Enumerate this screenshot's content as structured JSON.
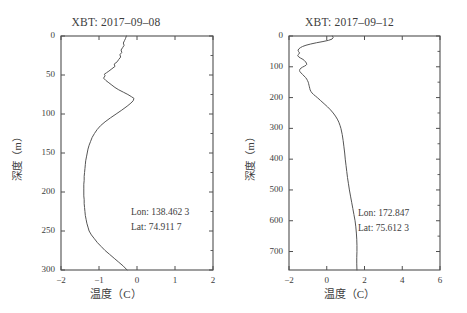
{
  "chart_data": [
    {
      "type": "line",
      "title": "XBT: 2017–09–08",
      "xlabel": "温度（C）",
      "ylabel": "深度（m）",
      "xlim": [
        -2,
        2
      ],
      "ylim": [
        0,
        300
      ],
      "y_inverted": true,
      "grid": false,
      "xticks": [
        -2,
        -1,
        0,
        1,
        2
      ],
      "xtick_labels": [
        "−2",
        "−1",
        "0",
        "1",
        "2"
      ],
      "yticks": [
        0,
        50,
        100,
        150,
        200,
        250,
        300
      ],
      "ytick_labels": [
        "0",
        "50",
        "100",
        "150",
        "200",
        "250",
        "300"
      ],
      "annotations": [
        "Lon: 138.462 3",
        "Lat: 74.911 7"
      ],
      "series_name": "temperature-profile",
      "line_color": "#555555",
      "depth": [
        0,
        3,
        6,
        9,
        12,
        15,
        18,
        21,
        24,
        27,
        30,
        33,
        36,
        39,
        42,
        45,
        47,
        49,
        51,
        54,
        57,
        60,
        63,
        66,
        69,
        72,
        75,
        78,
        80,
        83,
        86,
        90,
        95,
        100,
        105,
        110,
        115,
        120,
        125,
        130,
        135,
        140,
        145,
        150,
        155,
        160,
        165,
        170,
        175,
        180,
        185,
        190,
        195,
        200,
        205,
        210,
        215,
        220,
        225,
        230,
        235,
        240,
        245,
        250,
        255,
        260,
        265,
        270,
        275,
        280,
        285,
        290,
        295,
        300
      ],
      "temperature": [
        -0.28,
        -0.3,
        -0.33,
        -0.36,
        -0.34,
        -0.38,
        -0.42,
        -0.4,
        -0.45,
        -0.43,
        -0.48,
        -0.52,
        -0.6,
        -0.58,
        -0.66,
        -0.74,
        -0.8,
        -0.86,
        -0.84,
        -0.88,
        -0.82,
        -0.74,
        -0.66,
        -0.58,
        -0.48,
        -0.36,
        -0.24,
        -0.14,
        -0.08,
        -0.1,
        -0.16,
        -0.26,
        -0.4,
        -0.55,
        -0.7,
        -0.84,
        -0.96,
        -1.05,
        -1.12,
        -1.18,
        -1.22,
        -1.26,
        -1.29,
        -1.31,
        -1.33,
        -1.35,
        -1.36,
        -1.37,
        -1.38,
        -1.39,
        -1.39,
        -1.4,
        -1.4,
        -1.4,
        -1.4,
        -1.39,
        -1.39,
        -1.38,
        -1.37,
        -1.36,
        -1.34,
        -1.32,
        -1.29,
        -1.26,
        -1.2,
        -1.12,
        -1.04,
        -0.94,
        -0.84,
        -0.72,
        -0.6,
        -0.48,
        -0.36,
        -0.26
      ]
    },
    {
      "type": "line",
      "title": "XBT: 2017–09–12",
      "xlabel": "温度（C）",
      "ylabel": "深度（m）",
      "xlim": [
        -2,
        6
      ],
      "ylim": [
        0,
        760
      ],
      "y_inverted": true,
      "grid": false,
      "xticks": [
        -2,
        0,
        2,
        4,
        6
      ],
      "xtick_labels": [
        "−2",
        "0",
        "2",
        "4",
        "6"
      ],
      "yticks": [
        0,
        100,
        200,
        300,
        400,
        500,
        600,
        700
      ],
      "ytick_labels": [
        "0",
        "100",
        "200",
        "300",
        "400",
        "500",
        "600",
        "700"
      ],
      "annotations": [
        "Lon: 172.847",
        "Lat: 75.612 3"
      ],
      "series_name": "temperature-profile",
      "line_color": "#555555",
      "depth": [
        0,
        5,
        10,
        14,
        18,
        22,
        26,
        30,
        34,
        38,
        42,
        46,
        50,
        55,
        60,
        64,
        68,
        72,
        76,
        80,
        84,
        88,
        92,
        95,
        98,
        101,
        104,
        108,
        112,
        116,
        120,
        125,
        130,
        135,
        140,
        145,
        150,
        155,
        160,
        165,
        170,
        175,
        180,
        185,
        190,
        195,
        200,
        210,
        220,
        230,
        240,
        250,
        260,
        270,
        280,
        290,
        300,
        320,
        340,
        360,
        380,
        400,
        420,
        440,
        460,
        480,
        500,
        520,
        540,
        560,
        580,
        600,
        620,
        640,
        660,
        680,
        700,
        720,
        740,
        760
      ],
      "temperature": [
        0.3,
        0.34,
        0.28,
        0.1,
        -0.2,
        -0.55,
        -0.85,
        -1.1,
        -1.28,
        -1.4,
        -1.48,
        -1.52,
        -1.5,
        -1.44,
        -1.5,
        -1.54,
        -1.48,
        -1.38,
        -1.26,
        -1.18,
        -1.12,
        -1.08,
        -1.06,
        -1.1,
        -1.18,
        -1.28,
        -1.36,
        -1.42,
        -1.44,
        -1.42,
        -1.36,
        -1.28,
        -1.2,
        -1.12,
        -1.06,
        -1.02,
        -0.98,
        -0.96,
        -0.94,
        -0.92,
        -0.9,
        -0.88,
        -0.84,
        -0.78,
        -0.7,
        -0.6,
        -0.5,
        -0.32,
        -0.14,
        0.04,
        0.2,
        0.34,
        0.46,
        0.56,
        0.64,
        0.7,
        0.75,
        0.82,
        0.87,
        0.91,
        0.95,
        0.98,
        1.02,
        1.06,
        1.1,
        1.15,
        1.2,
        1.26,
        1.32,
        1.38,
        1.44,
        1.5,
        1.54,
        1.57,
        1.59,
        1.6,
        1.6,
        1.59,
        1.59,
        1.6
      ]
    }
  ]
}
